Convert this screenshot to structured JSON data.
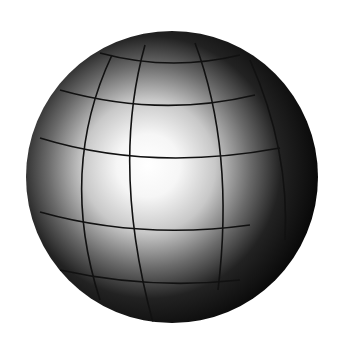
{
  "image": {
    "subject": "shaded globe with latitude and longitude grid lines",
    "description": "Grayscale sphere lit from the front-left, with a bright highlight and dark edges",
    "colors": {
      "background": "#ffffff",
      "highlight": "#ffffff",
      "shadow": "#050505",
      "grid": "#111111"
    },
    "grid": {
      "latitude_lines": 5,
      "longitude_lines": 4
    }
  }
}
